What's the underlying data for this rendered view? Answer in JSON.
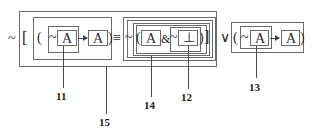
{
  "formula": {
    "prefix_neg": "~",
    "open_bracket": "[",
    "left": {
      "open_paren": "(",
      "neg": "~",
      "atom1": "A",
      "atom2": "A",
      "close_paren": ")"
    },
    "equiv": "≡",
    "right": {
      "neg": "~",
      "open_paren": "(",
      "atom": "A",
      "and": "&",
      "neg2": "~",
      "falsum": "⊥",
      "close_paren": ")",
      "close_bracket": "]"
    },
    "or": "∨",
    "third": {
      "open_paren": "(",
      "neg": "~",
      "atom1": "A",
      "atom2": "A",
      "close_paren": ")"
    }
  },
  "labels": {
    "l11": "11",
    "l12": "12",
    "l13": "13",
    "l14": "14",
    "l15": "15"
  }
}
